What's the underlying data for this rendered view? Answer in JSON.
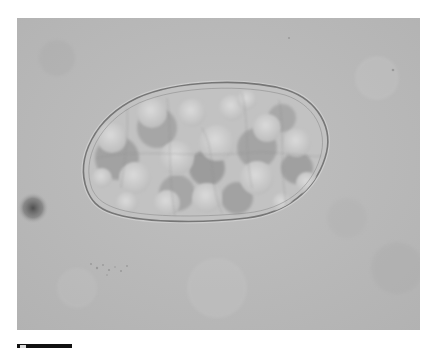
{
  "figure": {
    "type": "light-micrograph",
    "colors": {
      "page_background": "#ffffff",
      "field_background": "#b9b9b9",
      "egg_fill": "#c4c4c4",
      "egg_shell": "#7a7a7a",
      "cell_highlight": "#d6d6d6",
      "cell_shadow": "#9a9a9a",
      "dark_spot": "#4a4a4a",
      "scale_bar": "#111111"
    }
  },
  "scale_bar": {
    "label": ""
  }
}
